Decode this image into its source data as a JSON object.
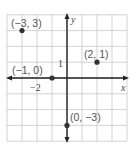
{
  "chart_data": {
    "type": "scatter",
    "title": "",
    "xlabel": "x",
    "ylabel": "y",
    "xlim": [
      -4,
      4
    ],
    "ylim": [
      -4,
      4
    ],
    "grid": true,
    "tick_labels": {
      "x": [
        {
          "value": -2,
          "label": "−2"
        }
      ],
      "y": [
        {
          "value": 1,
          "label": "1"
        }
      ]
    },
    "points": [
      {
        "x": -3,
        "y": 3,
        "label": "(−3, 3)"
      },
      {
        "x": 2,
        "y": 1,
        "label": "(2, 1)"
      },
      {
        "x": -1,
        "y": 0,
        "label": "(−1, 0)"
      },
      {
        "x": 0,
        "y": -3,
        "label": "(0, −3)"
      }
    ]
  },
  "colors": {
    "grid": "#c8c8c8",
    "axis": "#222222",
    "point": "#333333",
    "label": "#555555"
  }
}
